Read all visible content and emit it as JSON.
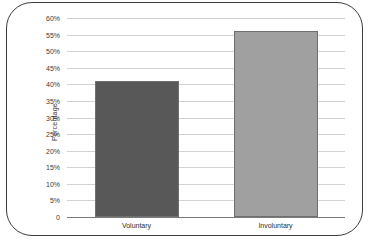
{
  "chart_data": {
    "type": "bar",
    "title": "",
    "xlabel": "",
    "ylabel": "Percentage",
    "categories": [
      "Voluntary",
      "Involuntary"
    ],
    "values": [
      41,
      56
    ],
    "ylim": [
      0,
      60
    ],
    "ytick_labels": [
      "60%",
      "55%",
      "50%",
      "45%",
      "40%",
      "35%",
      "30%",
      "25%",
      "20%",
      "15%",
      "10%",
      "5%",
      "0"
    ],
    "ytick_values": [
      60,
      55,
      50,
      45,
      40,
      35,
      30,
      25,
      20,
      15,
      10,
      5,
      0
    ],
    "grid": true,
    "legend": "none",
    "bar_colors": [
      "#585858",
      "#a0a0a0"
    ],
    "bar_border_color": "#6f6f6f",
    "gridline_color": "#d2d2d2",
    "baseline_color": "#7a7a7a",
    "frame_color": "#3d3d3d",
    "background": "#ffffff"
  },
  "axis": {
    "y_title": "Percentage"
  },
  "ticks": {
    "y": [
      {
        "label": "60%",
        "value": 60
      },
      {
        "label": "55%",
        "value": 55
      },
      {
        "label": "50%",
        "value": 50
      },
      {
        "label": "45%",
        "value": 45
      },
      {
        "label": "40%",
        "value": 40
      },
      {
        "label": "35%",
        "value": 35
      },
      {
        "label": "30%",
        "value": 30
      },
      {
        "label": "25%",
        "value": 25
      },
      {
        "label": "20%",
        "value": 20
      },
      {
        "label": "15%",
        "value": 15
      },
      {
        "label": "10%",
        "value": 10
      },
      {
        "label": "5%",
        "value": 5
      },
      {
        "label": "0",
        "value": 0
      }
    ]
  },
  "bars": [
    {
      "label": "Voluntary",
      "value": 41,
      "color": "#585858"
    },
    {
      "label": "Involuntary",
      "value": 56,
      "color": "#a0a0a0"
    }
  ]
}
